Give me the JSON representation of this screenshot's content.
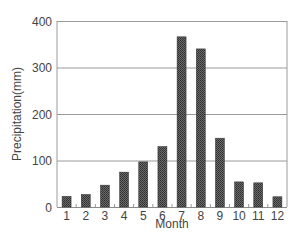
{
  "chart_data": {
    "type": "bar",
    "title": "",
    "xlabel": "Month",
    "ylabel": "Precipitation(mm)",
    "categories": [
      "1",
      "2",
      "3",
      "4",
      "5",
      "6",
      "7",
      "8",
      "9",
      "10",
      "11",
      "12"
    ],
    "values": [
      23,
      27,
      47,
      75,
      97,
      130,
      366,
      340,
      148,
      54,
      52,
      22
    ],
    "ylim": [
      0,
      400
    ],
    "yticks": [
      0,
      100,
      200,
      300,
      400
    ],
    "grid": "horizontal",
    "legend": "none",
    "bar_color": "#555555",
    "bar_pattern": "checker"
  }
}
